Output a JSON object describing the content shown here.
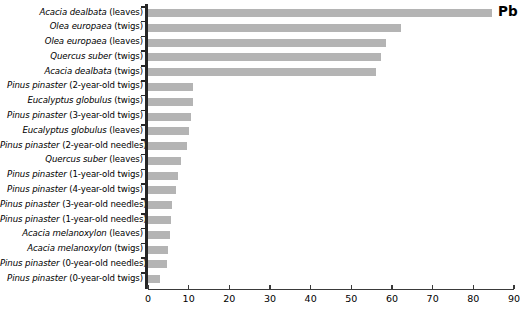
{
  "chart_data": {
    "type": "bar",
    "orientation": "horizontal",
    "title": "",
    "series_label": "Pb",
    "xlabel": "",
    "ylabel": "",
    "xlim": [
      0,
      90
    ],
    "xticks": [
      0,
      10,
      20,
      30,
      40,
      50,
      60,
      70,
      80,
      90
    ],
    "grid": false,
    "legend": "none",
    "bar_color": "#b4b4b4",
    "axis_color": "#262626",
    "categories": [
      "Acacia dealbata (leaves)",
      "Olea europaea (twigs)",
      "Olea europaea (leaves)",
      "Quercus suber (twigs)",
      "Acacia dealbata (twigs)",
      "Pinus pinaster (2-year-old twigs)",
      "Eucalyptus globulus (twigs)",
      "Pinus pinaster (3-year-old twigs)",
      "Eucalyptus globulus (leaves)",
      "Pinus pinaster (2-year-old needles)",
      "Quercus suber (leaves)",
      "Pinus pinaster (1-year-old twigs)",
      "Pinus pinaster (4-year-old twigs)",
      "Pinus pinaster (3-year-old needles)",
      "Pinus pinaster (1-year-old needles)",
      "Acacia melanoxylon (leaves)",
      "Acacia melanoxylon (twigs)",
      "Pinus pinaster (0-year-old needles)",
      "Pinus pinaster (0-year-old twigs)"
    ],
    "category_parts": [
      {
        "species": "Acacia dealbata",
        "part": " (leaves)"
      },
      {
        "species": "Olea europaea",
        "part": " (twigs)"
      },
      {
        "species": "Olea europaea",
        "part": " (leaves)"
      },
      {
        "species": "Quercus suber",
        "part": " (twigs)"
      },
      {
        "species": "Acacia dealbata",
        "part": " (twigs)"
      },
      {
        "species": "Pinus pinaster",
        "part": " (2-year-old twigs)"
      },
      {
        "species": "Eucalyptus globulus",
        "part": " (twigs)"
      },
      {
        "species": "Pinus pinaster",
        "part": " (3-year-old twigs)"
      },
      {
        "species": "Eucalyptus globulus",
        "part": " (leaves)"
      },
      {
        "species": "Pinus pinaster",
        "part": " (2-year-old needles)"
      },
      {
        "species": "Quercus suber",
        "part": " (leaves)"
      },
      {
        "species": "Pinus pinaster",
        "part": " (1-year-old twigs)"
      },
      {
        "species": "Pinus pinaster",
        "part": " (4-year-old twigs)"
      },
      {
        "species": "Pinus pinaster",
        "part": " (3-year-old needles)"
      },
      {
        "species": "Pinus pinaster",
        "part": " (1-year-old needles)"
      },
      {
        "species": "Acacia melanoxylon",
        "part": " (leaves)"
      },
      {
        "species": "Acacia melanoxylon",
        "part": " (twigs)"
      },
      {
        "species": "Pinus pinaster",
        "part": " (0-year-old needles)"
      },
      {
        "species": "Pinus pinaster",
        "part": " (0-year-old twigs)"
      }
    ],
    "values": [
      84.6,
      62.3,
      58.5,
      57.2,
      56.0,
      11.1,
      11.1,
      10.5,
      10.2,
      9.6,
      8.0,
      7.4,
      7.0,
      5.9,
      5.6,
      5.3,
      4.8,
      4.7,
      3.0
    ]
  }
}
